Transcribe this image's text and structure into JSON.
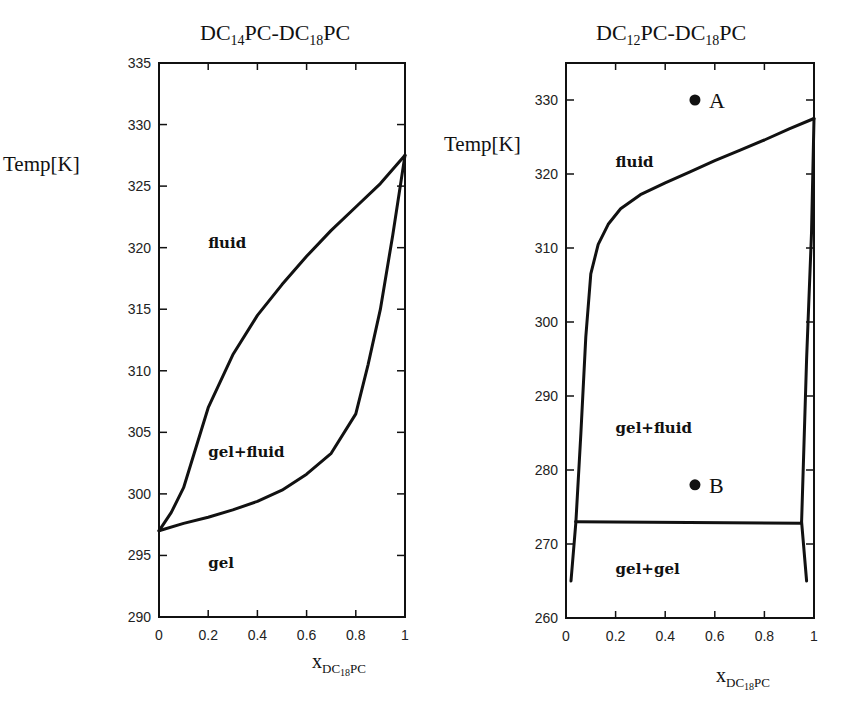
{
  "chart_data": [
    {
      "type": "line",
      "title": "DC14PC-DC18PC",
      "title_parts": {
        "a": "DC",
        "a_sub": "14",
        "b": "PC-DC",
        "b_sub": "18",
        "c": "PC"
      },
      "xlabel": "x_DC18PC",
      "xlabel_parts": {
        "main": "x",
        "sub": "DC",
        "sub2": "18",
        "sub3": "PC"
      },
      "ylabel": "Temp[K]",
      "xlim": [
        0,
        1
      ],
      "ylim": [
        290,
        335
      ],
      "x_ticks": [
        "0",
        "0.2",
        "0.4",
        "0.6",
        "0.8",
        "1"
      ],
      "y_ticks": [
        "290",
        "295",
        "300",
        "305",
        "310",
        "315",
        "320",
        "325",
        "330",
        "335"
      ],
      "grid": false,
      "series": [
        {
          "name": "liquidus (fluid boundary)",
          "x": [
            0,
            0.05,
            0.1,
            0.2,
            0.3,
            0.4,
            0.5,
            0.6,
            0.7,
            0.8,
            0.9,
            1.0
          ],
          "y": [
            297,
            298.5,
            300.5,
            307,
            311.3,
            314.5,
            317,
            319.3,
            321.4,
            323.3,
            325.2,
            327.5
          ]
        },
        {
          "name": "solidus (gel boundary)",
          "x": [
            0,
            0.1,
            0.2,
            0.3,
            0.4,
            0.5,
            0.6,
            0.7,
            0.8,
            0.85,
            0.9,
            0.95,
            1.0
          ],
          "y": [
            297,
            297.6,
            298.1,
            298.7,
            299.4,
            300.3,
            301.6,
            303.3,
            306.5,
            310.5,
            315,
            321,
            327.5
          ]
        }
      ],
      "annotations": [
        {
          "text": "fluid",
          "x": 0.2,
          "y": 320
        },
        {
          "text": "gel+fluid",
          "x": 0.2,
          "y": 303
        },
        {
          "text": "gel",
          "x": 0.2,
          "y": 294
        }
      ]
    },
    {
      "type": "line",
      "title": "DC12PC-DC18PC",
      "title_parts": {
        "a": "DC",
        "a_sub": "12",
        "b": "PC-DC",
        "b_sub": "18",
        "c": "PC"
      },
      "xlabel": "x_DC18PC",
      "xlabel_parts": {
        "main": "x",
        "sub": "DC",
        "sub2": "18",
        "sub3": "PC"
      },
      "ylabel": "Temp[K]",
      "xlim": [
        0,
        1
      ],
      "ylim": [
        260,
        335
      ],
      "x_ticks": [
        "0",
        "0.2",
        "0.4",
        "0.6",
        "0.8",
        "1"
      ],
      "y_ticks": [
        "260",
        "270",
        "280",
        "290",
        "300",
        "310",
        "320",
        "330"
      ],
      "grid": false,
      "series": [
        {
          "name": "liquidus (fluid boundary)",
          "x": [
            0.04,
            0.06,
            0.08,
            0.1,
            0.13,
            0.17,
            0.22,
            0.3,
            0.4,
            0.5,
            0.6,
            0.7,
            0.8,
            0.9,
            1.0
          ],
          "y": [
            273,
            285,
            298,
            306.5,
            310.5,
            313.2,
            315.3,
            317.2,
            318.8,
            320.3,
            321.8,
            323.2,
            324.6,
            326.1,
            327.5
          ]
        },
        {
          "name": "solidus right (gel boundary)",
          "x": [
            0.95,
            0.97,
            0.99,
            1.0
          ],
          "y": [
            273,
            295,
            312,
            327.5
          ]
        },
        {
          "name": "eutectic line",
          "x": [
            0.04,
            0.95
          ],
          "y": [
            273,
            272.8
          ]
        },
        {
          "name": "gel+gel left boundary",
          "x": [
            0.02,
            0.04
          ],
          "y": [
            265,
            273
          ]
        },
        {
          "name": "gel+gel right boundary",
          "x": [
            0.97,
            0.95
          ],
          "y": [
            265,
            273
          ]
        }
      ],
      "points": [
        {
          "label": "A",
          "x": 0.52,
          "y": 330
        },
        {
          "label": "B",
          "x": 0.52,
          "y": 278
        }
      ],
      "annotations": [
        {
          "text": "fluid",
          "x": 0.2,
          "y": 321
        },
        {
          "text": "gel+fluid",
          "x": 0.2,
          "y": 285
        },
        {
          "text": "gel+gel",
          "x": 0.2,
          "y": 266
        }
      ]
    }
  ]
}
